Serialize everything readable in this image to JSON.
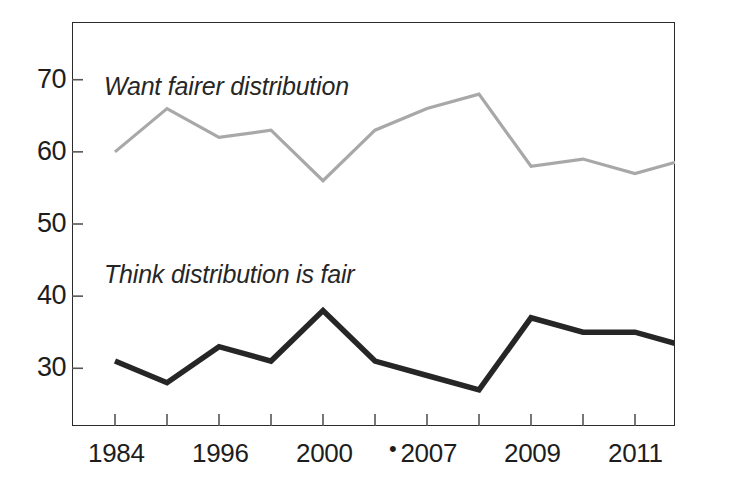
{
  "chart_data": {
    "type": "line",
    "title": "",
    "subtitle": "",
    "xlabel": "",
    "ylabel": "",
    "xlim": [
      0,
      11
    ],
    "ylim": [
      22,
      78
    ],
    "yticks": [
      30,
      40,
      50,
      60,
      70
    ],
    "ytick_labels": [
      "70",
      "60",
      "50",
      "40",
      "30"
    ],
    "grid": false,
    "legend": "inline-annotations",
    "x_tick_count": 11,
    "xtick_labels": [
      {
        "text": "1984",
        "pre_mark": "",
        "index": 0
      },
      {
        "text": "1996",
        "pre_mark": "",
        "index": 2
      },
      {
        "text": "2000",
        "pre_mark": "",
        "index": 4
      },
      {
        "text": "2007",
        "pre_mark": "•",
        "index": 6
      },
      {
        "text": "2009",
        "pre_mark": "",
        "index": 8
      },
      {
        "text": "2011",
        "pre_mark": "",
        "index": 10
      }
    ],
    "x": [
      0,
      1,
      2,
      3,
      4,
      5,
      6,
      7,
      8,
      9,
      10,
      11
    ],
    "series": [
      {
        "name": "Want fairer distribution",
        "color": "#a8a8a8",
        "values": [
          60,
          66,
          62,
          63,
          56,
          63,
          66,
          68,
          58,
          59,
          57,
          59
        ]
      },
      {
        "name": "Think distribution is fair",
        "color": "#262626",
        "values": [
          31,
          28,
          33,
          31,
          38,
          31,
          29,
          27,
          37,
          35,
          35,
          33
        ]
      }
    ],
    "annotations": [
      {
        "text": "Want fairer distribution",
        "series": "Want fairer distribution"
      },
      {
        "text": "Think distribution is fair",
        "series": "Think distribution is fair"
      }
    ]
  },
  "axis": {
    "frame_color": "#2b2b2b",
    "tick_color": "#555555"
  }
}
